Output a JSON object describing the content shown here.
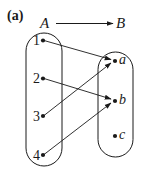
{
  "panel_label": "(a)",
  "mapping": {
    "domain_name": "A",
    "codomain_name": "B",
    "domain": [
      {
        "label": "1",
        "x": 43,
        "y": 40
      },
      {
        "label": "2",
        "x": 43,
        "y": 78
      },
      {
        "label": "3",
        "x": 43,
        "y": 116
      },
      {
        "label": "4",
        "x": 43,
        "y": 155
      }
    ],
    "codomain": [
      {
        "label": "a",
        "x": 115,
        "y": 60
      },
      {
        "label": "b",
        "x": 115,
        "y": 100
      },
      {
        "label": "c",
        "x": 115,
        "y": 136
      }
    ],
    "arrows": [
      {
        "from": "1",
        "to": "a"
      },
      {
        "from": "2",
        "to": "b"
      },
      {
        "from": "3",
        "to": "a"
      },
      {
        "from": "4",
        "to": "b"
      }
    ]
  },
  "colors": {
    "stroke": "#1a1a1a",
    "background": "#ffffff"
  }
}
